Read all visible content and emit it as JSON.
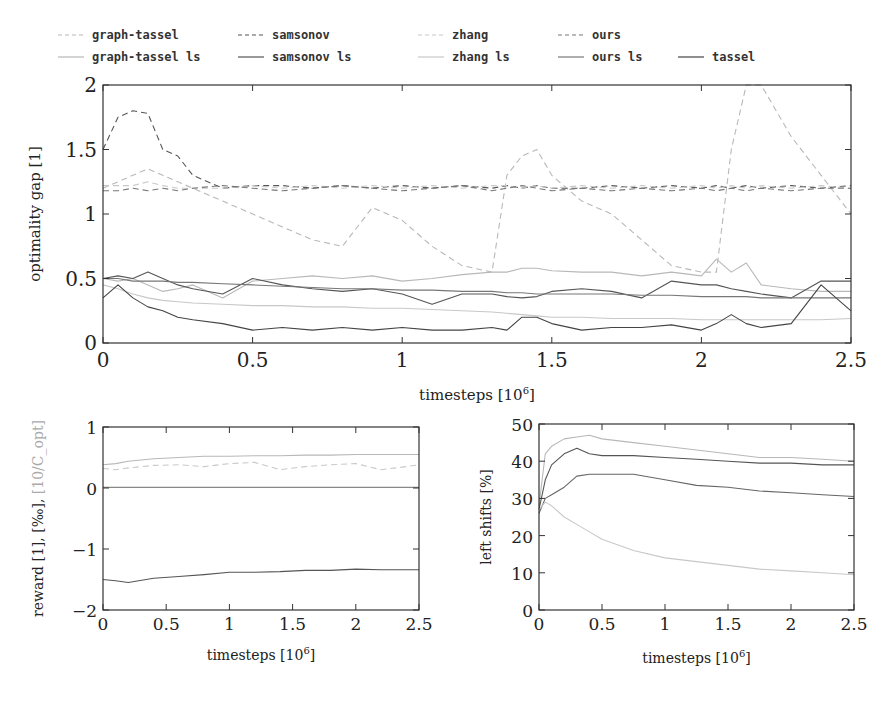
{
  "legend": {
    "items": [
      {
        "label": "graph-tassel",
        "style": "dashed",
        "color": "#b8b8b8",
        "row": 0,
        "x": 103
      },
      {
        "label": "samsonov",
        "style": "dashed",
        "color": "#555555",
        "row": 0,
        "x": 283
      },
      {
        "label": "zhang",
        "style": "dashed",
        "color": "#c8c8c8",
        "row": 0,
        "x": 463
      },
      {
        "label": "ours",
        "style": "dashed",
        "color": "#777777",
        "row": 0,
        "x": 603
      },
      {
        "label": "graph-tassel ls",
        "style": "solid",
        "color": "#b8b8b8",
        "row": 1,
        "x": 103
      },
      {
        "label": "samsonov ls",
        "style": "solid",
        "color": "#555555",
        "row": 1,
        "x": 283
      },
      {
        "label": "zhang ls",
        "style": "solid",
        "color": "#c8c8c8",
        "row": 1,
        "x": 463
      },
      {
        "label": "ours ls",
        "style": "solid",
        "color": "#777777",
        "row": 1,
        "x": 603
      },
      {
        "label": "tassel",
        "style": "solid",
        "color": "#444444",
        "row": 1,
        "x": 723
      }
    ]
  },
  "chart_data": [
    {
      "type": "line",
      "title": "",
      "xlabel": "timesteps [10^6]",
      "ylabel": "optimality gap [1]",
      "xlim": [
        0,
        2.5
      ],
      "ylim": [
        0,
        2
      ],
      "xticks": [
        "0",
        "0.5",
        "1",
        "1.5",
        "2",
        "2.5"
      ],
      "yticks": [
        "0",
        "0.5",
        "1",
        "1.5",
        "2"
      ],
      "grid": false,
      "legend_position": "top (shared)",
      "x": [
        0,
        0.05,
        0.1,
        0.15,
        0.2,
        0.25,
        0.3,
        0.4,
        0.5,
        0.6,
        0.7,
        0.8,
        0.9,
        1.0,
        1.1,
        1.2,
        1.3,
        1.35,
        1.4,
        1.45,
        1.5,
        1.6,
        1.7,
        1.8,
        1.9,
        2.0,
        2.05,
        2.1,
        2.15,
        2.2,
        2.3,
        2.4,
        2.5
      ],
      "series": [
        {
          "name": "graph-tassel",
          "style": "dashed",
          "color": "#b8b8b8",
          "values": [
            1.2,
            1.25,
            1.3,
            1.35,
            1.3,
            1.25,
            1.2,
            1.1,
            1.0,
            0.9,
            0.8,
            0.75,
            1.05,
            0.95,
            0.75,
            0.6,
            0.55,
            1.3,
            1.45,
            1.5,
            1.3,
            1.1,
            1.0,
            0.8,
            0.6,
            0.55,
            0.55,
            1.5,
            2.0,
            2.0,
            1.6,
            1.3,
            1.0
          ]
        },
        {
          "name": "samsonov",
          "style": "dashed",
          "color": "#555555",
          "values": [
            1.5,
            1.75,
            1.8,
            1.78,
            1.5,
            1.45,
            1.3,
            1.2,
            1.22,
            1.22,
            1.2,
            1.22,
            1.2,
            1.22,
            1.2,
            1.22,
            1.2,
            1.22,
            1.2,
            1.22,
            1.2,
            1.2,
            1.22,
            1.2,
            1.22,
            1.2,
            1.22,
            1.2,
            1.22,
            1.2,
            1.22,
            1.2,
            1.22
          ]
        },
        {
          "name": "zhang",
          "style": "dashed",
          "color": "#c8c8c8",
          "values": [
            1.22,
            1.22,
            1.22,
            1.25,
            1.22,
            1.2,
            1.2,
            1.2,
            1.22,
            1.2,
            1.22,
            1.2,
            1.22,
            1.2,
            1.22,
            1.2,
            1.22,
            1.22,
            1.2,
            1.22,
            1.2,
            1.22,
            1.2,
            1.22,
            1.2,
            1.22,
            1.2,
            1.22,
            1.2,
            1.22,
            1.2,
            1.22,
            1.2
          ]
        },
        {
          "name": "ours",
          "style": "dashed",
          "color": "#777777",
          "values": [
            1.18,
            1.18,
            1.2,
            1.18,
            1.2,
            1.18,
            1.2,
            1.22,
            1.2,
            1.18,
            1.2,
            1.22,
            1.2,
            1.18,
            1.2,
            1.22,
            1.18,
            1.2,
            1.22,
            1.2,
            1.18,
            1.2,
            1.18,
            1.2,
            1.18,
            1.2,
            1.18,
            1.2,
            1.18,
            1.2,
            1.18,
            1.2,
            1.2
          ]
        },
        {
          "name": "graph-tassel ls",
          "style": "solid",
          "color": "#b8b8b8",
          "values": [
            0.5,
            0.48,
            0.5,
            0.45,
            0.4,
            0.42,
            0.45,
            0.35,
            0.48,
            0.5,
            0.52,
            0.5,
            0.52,
            0.48,
            0.5,
            0.53,
            0.55,
            0.55,
            0.58,
            0.58,
            0.56,
            0.55,
            0.55,
            0.52,
            0.55,
            0.52,
            0.65,
            0.55,
            0.62,
            0.45,
            0.42,
            0.4,
            0.4
          ]
        },
        {
          "name": "samsonov ls",
          "style": "solid",
          "color": "#555555",
          "values": [
            0.5,
            0.52,
            0.5,
            0.55,
            0.5,
            0.45,
            0.42,
            0.38,
            0.5,
            0.45,
            0.42,
            0.4,
            0.42,
            0.38,
            0.3,
            0.38,
            0.38,
            0.36,
            0.35,
            0.36,
            0.4,
            0.42,
            0.4,
            0.35,
            0.48,
            0.45,
            0.45,
            0.42,
            0.4,
            0.38,
            0.35,
            0.48,
            0.48
          ]
        },
        {
          "name": "zhang ls",
          "style": "solid",
          "color": "#c8c8c8",
          "values": [
            0.45,
            0.42,
            0.38,
            0.35,
            0.33,
            0.32,
            0.31,
            0.3,
            0.29,
            0.29,
            0.28,
            0.28,
            0.27,
            0.27,
            0.26,
            0.25,
            0.24,
            0.23,
            0.22,
            0.21,
            0.2,
            0.2,
            0.19,
            0.19,
            0.19,
            0.18,
            0.18,
            0.18,
            0.18,
            0.18,
            0.18,
            0.18,
            0.19
          ]
        },
        {
          "name": "ours ls",
          "style": "solid",
          "color": "#777777",
          "values": [
            0.5,
            0.5,
            0.48,
            0.48,
            0.48,
            0.47,
            0.47,
            0.46,
            0.45,
            0.44,
            0.43,
            0.42,
            0.42,
            0.41,
            0.41,
            0.4,
            0.4,
            0.39,
            0.39,
            0.38,
            0.38,
            0.38,
            0.38,
            0.37,
            0.37,
            0.36,
            0.36,
            0.36,
            0.36,
            0.35,
            0.35,
            0.35,
            0.35
          ]
        },
        {
          "name": "tassel",
          "style": "solid",
          "color": "#444444",
          "values": [
            0.35,
            0.45,
            0.35,
            0.28,
            0.25,
            0.2,
            0.18,
            0.15,
            0.1,
            0.12,
            0.1,
            0.12,
            0.1,
            0.12,
            0.1,
            0.1,
            0.12,
            0.1,
            0.2,
            0.2,
            0.15,
            0.1,
            0.12,
            0.12,
            0.14,
            0.1,
            0.15,
            0.22,
            0.15,
            0.12,
            0.15,
            0.45,
            0.25
          ]
        }
      ]
    },
    {
      "type": "line",
      "title": "",
      "xlabel": "timesteps [10^6]",
      "ylabel": "reward [1], [‰], [10/C_opt]",
      "xlim": [
        0,
        2.5
      ],
      "ylim": [
        -2,
        1
      ],
      "xticks": [
        "0",
        "0.5",
        "1",
        "1.5",
        "2",
        "2.5"
      ],
      "yticks": [
        "−2",
        "−1",
        "0",
        "1"
      ],
      "grid": false,
      "x": [
        0,
        0.1,
        0.2,
        0.4,
        0.6,
        0.8,
        1.0,
        1.2,
        1.4,
        1.6,
        1.8,
        2.0,
        2.2,
        2.4,
        2.5
      ],
      "series": [
        {
          "name": "light solid",
          "style": "solid",
          "color": "#b8b8b8",
          "values": [
            0.38,
            0.4,
            0.44,
            0.48,
            0.5,
            0.52,
            0.52,
            0.53,
            0.53,
            0.54,
            0.54,
            0.55,
            0.55,
            0.55,
            0.55
          ]
        },
        {
          "name": "light dashed",
          "style": "dashed",
          "color": "#c8c8c8",
          "values": [
            0.32,
            0.3,
            0.33,
            0.37,
            0.38,
            0.35,
            0.4,
            0.42,
            0.3,
            0.35,
            0.38,
            0.4,
            0.3,
            0.35,
            0.38
          ]
        },
        {
          "name": "zero line",
          "style": "solid",
          "color": "#888888",
          "values": [
            0.01,
            0.01,
            0.01,
            0.01,
            0.01,
            0.01,
            0.01,
            0.01,
            0.01,
            0.01,
            0.01,
            0.01,
            0.01,
            0.01,
            0.01
          ]
        },
        {
          "name": "dark solid",
          "style": "solid",
          "color": "#555555",
          "values": [
            -1.5,
            -1.52,
            -1.55,
            -1.48,
            -1.45,
            -1.42,
            -1.38,
            -1.38,
            -1.37,
            -1.35,
            -1.35,
            -1.33,
            -1.34,
            -1.34,
            -1.34
          ]
        }
      ]
    },
    {
      "type": "line",
      "title": "",
      "xlabel": "timesteps [10^6]",
      "ylabel": "left shifts [%]",
      "xlim": [
        0,
        2.5
      ],
      "ylim": [
        0,
        50
      ],
      "xticks": [
        "0",
        "0.5",
        "1",
        "1.5",
        "2",
        "2.5"
      ],
      "yticks": [
        "0",
        "10",
        "20",
        "30",
        "40",
        "50"
      ],
      "grid": false,
      "x": [
        0,
        0.05,
        0.1,
        0.2,
        0.3,
        0.4,
        0.5,
        0.75,
        1.0,
        1.25,
        1.5,
        1.75,
        2.0,
        2.25,
        2.5
      ],
      "series": [
        {
          "name": "light solid top",
          "style": "solid",
          "color": "#b8b8b8",
          "values": [
            28,
            42,
            44,
            46,
            46.5,
            47,
            46,
            45,
            44,
            43,
            42,
            41,
            41,
            40.5,
            40
          ]
        },
        {
          "name": "dark solid upper",
          "style": "solid",
          "color": "#555555",
          "values": [
            27,
            35,
            39,
            42,
            43.5,
            42,
            41.5,
            41.5,
            41,
            40.5,
            40,
            39.5,
            39.5,
            39,
            39
          ]
        },
        {
          "name": "dark solid middle",
          "style": "solid",
          "color": "#666666",
          "values": [
            26,
            30,
            31,
            33,
            36,
            36.5,
            36.5,
            36.5,
            35,
            33.5,
            33,
            32,
            31.5,
            31,
            30.5
          ]
        },
        {
          "name": "light solid bottom",
          "style": "solid",
          "color": "#c8c8c8",
          "values": [
            27,
            29,
            28,
            25,
            23,
            21,
            19,
            16,
            14,
            13,
            12,
            11,
            10.5,
            10,
            9.5
          ]
        }
      ]
    }
  ]
}
